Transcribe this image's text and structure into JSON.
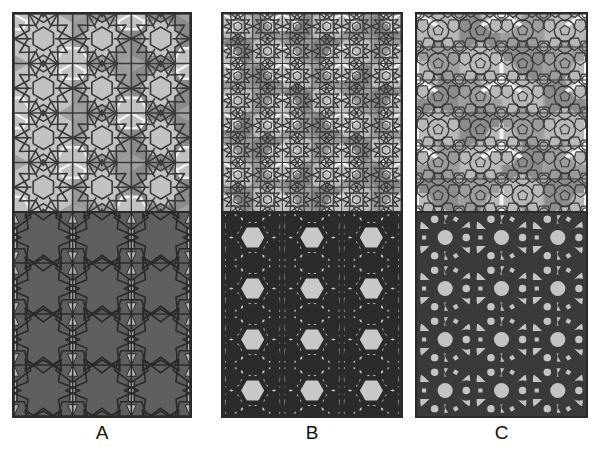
{
  "figure": {
    "background_color": "#ffffff",
    "width": 600,
    "height": 456,
    "panel_border_color": "#2a2a2a"
  },
  "panels": [
    {
      "id": "A",
      "caption": "A",
      "x": 12,
      "y": 12,
      "width": 180,
      "height": 406,
      "top_half": {
        "name": "polygonal-underlay-A",
        "background_color": "#a0a0a0",
        "tile_fill_light": "#c2c2c2",
        "tile_fill_mid": "#9a9a9a",
        "tile_fill_dark": "#8a8a8a",
        "highlight_color": "#f2f2f2",
        "line_color": "#3a3a3a",
        "line_width": 1.6,
        "motif": "interlocking 12-point rosettes with hexagonal cells",
        "repeat_cols": 3,
        "repeat_rows": 4
      },
      "bottom_half": {
        "name": "derived-tiling-A",
        "background_color": "#b8b8b8",
        "tile_fill": "#5f5f5f",
        "line_color": "#2a2a2a",
        "line_width": 1.6,
        "motif": "large dark polygon tiling with light interstitial bowties",
        "repeat_cols": 3,
        "repeat_rows": 4
      }
    },
    {
      "id": "B",
      "caption": "B",
      "x": 221,
      "y": 12,
      "width": 182,
      "height": 406,
      "top_half": {
        "name": "polygonal-underlay-B",
        "background_color": "#9e9e9e",
        "tile_fill_light": "#bdbdbd",
        "tile_fill_mid": "#989898",
        "tile_fill_dark": "#868686",
        "highlight_color": "#f2f2f2",
        "line_color": "#3a3a3a",
        "line_width": 1.2,
        "motif": "finer subdivided rosette grid, double density",
        "repeat_cols": 6,
        "repeat_rows": 8
      },
      "bottom_half": {
        "name": "derived-tiling-B",
        "background_color": "#c8c8c8",
        "strap_color": "#2b2b2b",
        "strap_width": 4.5,
        "motif": "dense interlaced strapwork knot with star rosettes",
        "repeat_cols": 3,
        "repeat_rows": 4
      }
    },
    {
      "id": "C",
      "caption": "C",
      "x": 415,
      "y": 12,
      "width": 173,
      "height": 406,
      "top_half": {
        "name": "polygonal-underlay-C",
        "background_color": "#a4a4a4",
        "tile_fill_light": "#b8b8b8",
        "tile_fill_mid": "#9c9c9c",
        "tile_fill_dark": "#8c8c8c",
        "highlight_color": "#f2f2f2",
        "line_color": "#3a3a3a",
        "line_width": 1.2,
        "motif": "rounded pentagon and decagon packing",
        "repeat_cols": 4,
        "repeat_rows": 6
      },
      "bottom_half": {
        "name": "derived-tiling-C",
        "background_color": "#c4c4c4",
        "strap_color": "#3a3a3a",
        "strap_width": 6.5,
        "motif": "wide-band strapwork with circles, stars and squares",
        "repeat_cols": 3,
        "repeat_rows": 4
      }
    }
  ],
  "captions": {
    "a": "A",
    "b": "B",
    "c": "C",
    "y": 422,
    "font_size_px": 19,
    "color": "#111111"
  }
}
